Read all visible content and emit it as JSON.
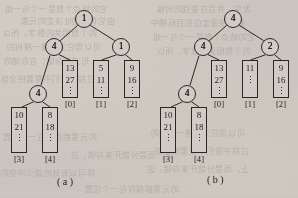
{
  "figure": {
    "panels": [
      {
        "id": "a",
        "caption": "( a )",
        "nodes": [
          {
            "name": "root",
            "label": "1",
            "x": 75,
            "y": 10
          },
          {
            "name": "left-child",
            "label": "4",
            "x": 45,
            "y": 38
          },
          {
            "name": "right-child",
            "label": "1",
            "x": 112,
            "y": 38
          },
          {
            "name": "grandchild",
            "label": "4",
            "x": 29,
            "y": 85
          }
        ],
        "buckets": [
          {
            "index": "[0]",
            "values": [
              "13",
              "27"
            ],
            "x": 62,
            "y": 60
          },
          {
            "index": "[1]",
            "values": [
              "5",
              "11"
            ],
            "x": 93,
            "y": 60
          },
          {
            "index": "[2]",
            "values": [
              "9",
              "16"
            ],
            "x": 124,
            "y": 60
          },
          {
            "index": "[3]",
            "values": [
              "10",
              "21"
            ],
            "x": 11,
            "y": 107
          },
          {
            "index": "[4]",
            "values": [
              "8",
              "18"
            ],
            "x": 42,
            "y": 107
          }
        ]
      },
      {
        "id": "b",
        "caption": "( b )",
        "nodes": [
          {
            "name": "root",
            "label": "4",
            "x": 224,
            "y": 10
          },
          {
            "name": "left-child",
            "label": "4",
            "x": 194,
            "y": 38
          },
          {
            "name": "right-child",
            "label": "2",
            "x": 261,
            "y": 38
          },
          {
            "name": "grandchild",
            "label": "4",
            "x": 178,
            "y": 85
          }
        ],
        "buckets": [
          {
            "index": "[0]",
            "values": [
              "13",
              "27"
            ],
            "x": 211,
            "y": 60
          },
          {
            "index": "[1]",
            "values": [
              "11"
            ],
            "x": 242,
            "y": 60
          },
          {
            "index": "[2]",
            "values": [
              "9",
              "16"
            ],
            "x": 273,
            "y": 60
          },
          {
            "index": "[3]",
            "values": [
              "10",
              "21"
            ],
            "x": 160,
            "y": 107
          },
          {
            "index": "[4]",
            "values": [
              "8",
              "18"
            ],
            "x": 191,
            "y": 107
          }
        ]
      }
    ],
    "ellipsis": "⋮",
    "colors": {
      "ink": "#211e1a",
      "paper": "#cbc7c0",
      "bleed": "#a9a49c"
    }
  },
  "bleed_text": {
    "lines": [
      "它的结点个数是一个与一组",
      "由它们的地址决定的元素",
      "的个数相关的数字，所以",
      "可以用它去构建一棵树的",
      "形式来存储；在存储的",
      "过程中我们不需要把全部",
      "的元素都保存在一个位置",
      "上，而是分散开来存储，这",
      "样可以有效地减少冲突的",
      "发生，并且在查找的时候",
      "能够快速定位到目标桶中"
    ]
  }
}
